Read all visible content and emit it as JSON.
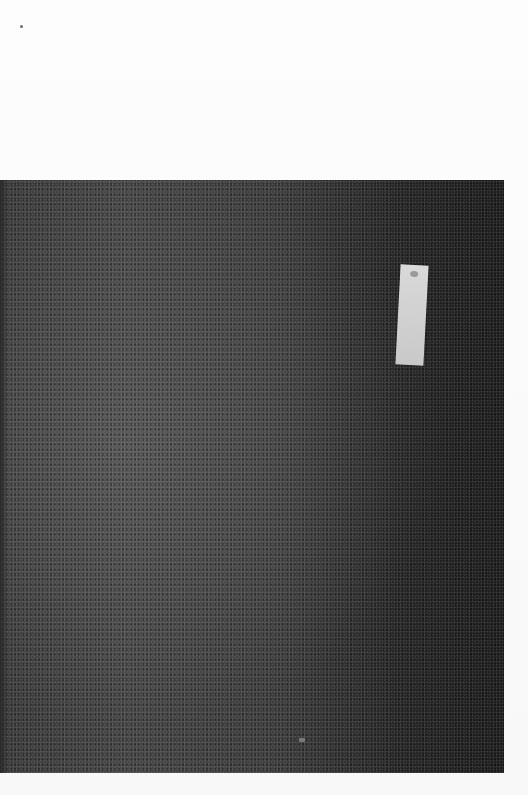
{
  "scene": {
    "description": "Photograph of a dark granular surface (asphalt/sandpaper-like) with a small white paper label, on a white background",
    "background_color": "#fbfbfb",
    "surface_color": "#3a3a3a",
    "label_color": "#d4d4d4"
  }
}
